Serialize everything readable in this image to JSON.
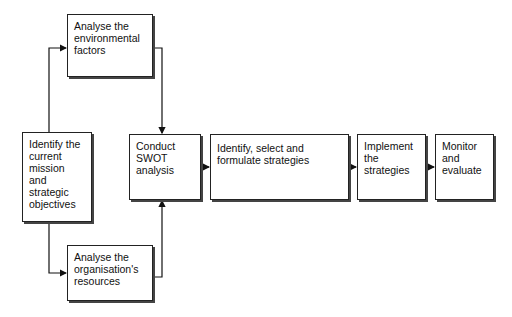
{
  "diagram": {
    "type": "flowchart",
    "nodes": [
      {
        "id": "mission",
        "label": "Identify the current mission and strategic objectives"
      },
      {
        "id": "environment",
        "label": "Analyse the environmental factors"
      },
      {
        "id": "resources",
        "label": "Analyse the organisation's resources"
      },
      {
        "id": "swot",
        "label": "Conduct SWOT analysis"
      },
      {
        "id": "strategies",
        "label": "Identify, select and formulate strategies"
      },
      {
        "id": "implement",
        "label": "Implement the strategies"
      },
      {
        "id": "monitor",
        "label": "Monitor and evaluate"
      }
    ],
    "edges": [
      {
        "from": "mission",
        "to": "environment"
      },
      {
        "from": "mission",
        "to": "resources"
      },
      {
        "from": "environment",
        "to": "swot"
      },
      {
        "from": "resources",
        "to": "swot"
      },
      {
        "from": "swot",
        "to": "strategies"
      },
      {
        "from": "strategies",
        "to": "implement"
      },
      {
        "from": "implement",
        "to": "monitor"
      }
    ]
  }
}
